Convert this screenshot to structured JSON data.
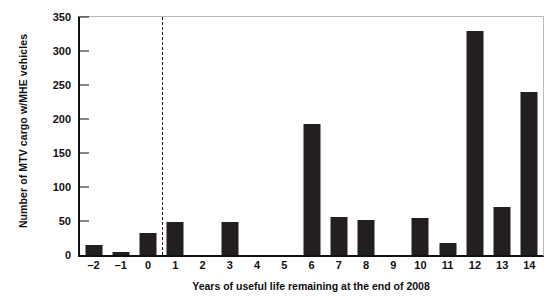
{
  "chart_data": {
    "type": "bar",
    "title": "",
    "xlabel": "Years of useful life remaining at the end of 2008",
    "ylabel": "Number of MTV cargo w/MHE vehicles",
    "categories": [
      "-2",
      "-1",
      "0",
      "1",
      "2",
      "3",
      "4",
      "5",
      "6",
      "7",
      "8",
      "9",
      "10",
      "11",
      "12",
      "13",
      "14"
    ],
    "values": [
      15,
      5,
      33,
      48,
      0,
      48,
      0,
      0,
      193,
      56,
      52,
      0,
      55,
      17,
      330,
      70,
      240
    ],
    "ylim": [
      0,
      350
    ],
    "yticks": [
      0,
      50,
      100,
      150,
      200,
      250,
      300,
      350
    ],
    "ytick_labels": [
      "0",
      "50",
      "100",
      "150",
      "200",
      "250",
      "300",
      "350"
    ],
    "grid": false,
    "legend": "none",
    "bar_color": "#231f20",
    "annotations": [
      {
        "name": "divider",
        "type": "vertical-dashed-line",
        "between": [
          "0",
          "1"
        ],
        "at_x": 0.5
      }
    ]
  }
}
